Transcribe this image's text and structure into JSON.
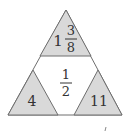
{
  "diagram": {
    "type": "triangle-puzzle",
    "colors": {
      "fill_gray": "#d9d9d9",
      "stroke": "#6e6e6e",
      "background": "#ffffff",
      "text": "#333333"
    },
    "top": {
      "whole": "1",
      "numerator": "3",
      "denominator": "8"
    },
    "center": {
      "numerator": "1",
      "denominator": "2"
    },
    "bottom_left": {
      "value": "4"
    },
    "bottom_right": {
      "value": "11"
    }
  }
}
